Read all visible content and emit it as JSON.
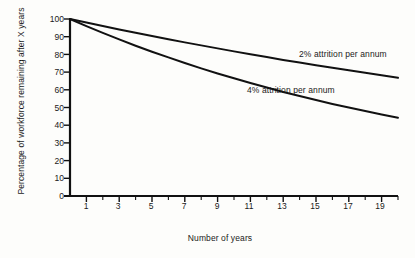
{
  "chart_data": {
    "type": "line",
    "title": "",
    "xlabel": "Number of years",
    "ylabel": "Percentage of workforce remaining after X years",
    "xlim": [
      0,
      20
    ],
    "ylim": [
      0,
      100
    ],
    "grid": false,
    "legend_position": "inline-annotation",
    "x_ticks_major": [
      1,
      3,
      5,
      7,
      9,
      11,
      13,
      15,
      17,
      19
    ],
    "x_ticks_minor": [
      2,
      4,
      6,
      8,
      10,
      12,
      14,
      16,
      18,
      20
    ],
    "y_ticks": [
      0,
      10,
      20,
      30,
      40,
      50,
      60,
      70,
      80,
      90,
      100
    ],
    "x": [
      0,
      1,
      2,
      3,
      4,
      5,
      6,
      7,
      8,
      9,
      10,
      11,
      12,
      13,
      14,
      15,
      16,
      17,
      18,
      19,
      20
    ],
    "series": [
      {
        "name": "2% attrition per annum",
        "label": "2% attrition per annum",
        "color": "#111111",
        "values": [
          100,
          98,
          96,
          94.1,
          92.2,
          90.4,
          88.6,
          86.8,
          85.1,
          83.4,
          81.7,
          80.1,
          78.5,
          76.9,
          75.4,
          73.9,
          72.4,
          71,
          69.6,
          68.2,
          66.8
        ]
      },
      {
        "name": "4% attrition per annum",
        "label": "4% attrition per annum",
        "color": "#111111",
        "values": [
          100,
          96,
          92.2,
          88.5,
          84.9,
          81.5,
          78.3,
          75.1,
          72.1,
          69.2,
          66.5,
          63.8,
          61.3,
          58.8,
          56.5,
          54.2,
          52,
          50,
          48,
          46.1,
          44.2
        ]
      }
    ]
  },
  "axes": {
    "x_title": "Number of years",
    "y_title": "Percentage of workforce remaining after X years"
  },
  "colors": {
    "line": "#111111",
    "axis": "#111111",
    "text": "#1a1a1a",
    "background": "#fdfdfb"
  }
}
